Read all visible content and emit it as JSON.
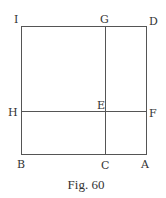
{
  "figure": {
    "caption": "Fig. 60",
    "points": {
      "I": "I",
      "G": "G",
      "D": "D",
      "H": "H",
      "E": "E",
      "F": "F",
      "B": "B",
      "C": "C",
      "A": "A"
    },
    "segments": [
      "ID",
      "DA",
      "AB",
      "BI",
      "GC",
      "HF"
    ],
    "colors": {
      "line": "#555555",
      "text": "#333333",
      "background": "#ffffff"
    }
  }
}
